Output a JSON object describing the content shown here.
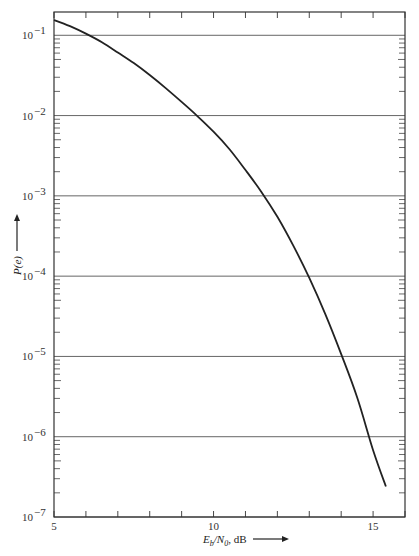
{
  "chart_data": {
    "type": "line",
    "title": "",
    "xlabel": "E_b/N_0, dB",
    "ylabel": "P(e)",
    "x_scale": "linear",
    "y_scale": "log",
    "xlim": [
      5,
      16
    ],
    "ylim": [
      1e-07,
      0.195
    ],
    "x_ticks": [
      5,
      6,
      7,
      8,
      9,
      10,
      11,
      12,
      13,
      14,
      15,
      16
    ],
    "x_tick_labels": [
      {
        "value": 5,
        "label": "5"
      },
      {
        "value": 10,
        "label": "10"
      },
      {
        "value": 15,
        "label": "15"
      }
    ],
    "y_tick_labels": [
      {
        "value": 0.1,
        "base": "10",
        "exp": "−1"
      },
      {
        "value": 0.01,
        "base": "10",
        "exp": "−2"
      },
      {
        "value": 0.001,
        "base": "10",
        "exp": "−3"
      },
      {
        "value": 0.0001,
        "base": "10",
        "exp": "−4"
      },
      {
        "value": 1e-05,
        "base": "10",
        "exp": "−5"
      },
      {
        "value": 1e-06,
        "base": "10",
        "exp": "−6"
      },
      {
        "value": 1e-07,
        "base": "10",
        "exp": "−7"
      }
    ],
    "grid": {
      "horizontal_decades": true,
      "vertical": false
    },
    "legend": null,
    "series": [
      {
        "name": "P(e)",
        "color": "#222222",
        "x": [
          5,
          5.5,
          6,
          6.5,
          7,
          7.5,
          8,
          8.5,
          9,
          9.5,
          10,
          10.5,
          11,
          11.5,
          12,
          12.5,
          13,
          13.5,
          14,
          14.5,
          15,
          15.4
        ],
        "y": [
          0.155,
          0.13,
          0.105,
          0.082,
          0.061,
          0.045,
          0.032,
          0.022,
          0.0148,
          0.0098,
          0.0063,
          0.0038,
          0.0021,
          0.00112,
          0.00055,
          0.00024,
          9.5e-05,
          3.4e-05,
          1.07e-05,
          3.1e-06,
          6.8e-07,
          2.4e-07
        ]
      }
    ]
  },
  "labels": {
    "x_axis_main": "E",
    "x_axis_sub_b": "b",
    "x_axis_slash": "/N",
    "x_axis_sub_0": "0",
    "x_axis_unit": ", dB",
    "y_axis": "P(e)"
  }
}
